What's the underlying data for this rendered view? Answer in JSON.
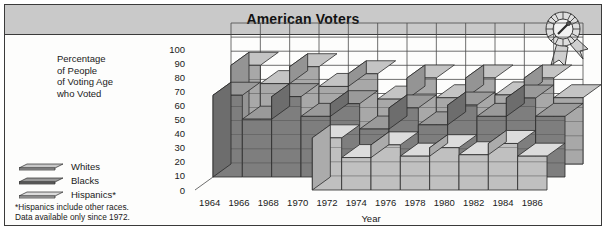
{
  "figure": {
    "title": "American Voters",
    "award_icon": "award-rosette-icon"
  },
  "axis_caption": {
    "line1": "Percentage",
    "line2": "of People",
    "line3": "of Voting Age",
    "line4": "who Voted"
  },
  "legend": {
    "items": [
      {
        "label": "Whites",
        "color": "#c4c4c4"
      },
      {
        "label": "Blacks",
        "color": "#8a8a8a"
      },
      {
        "label": "Hispanics*",
        "color": "#d6d6d6"
      }
    ]
  },
  "footnote": {
    "line1": "*Hispanics include other races.",
    "line2": "Data available only since 1972."
  },
  "colors": {
    "title_bar": "#c9c9c9",
    "frame_border": "#3a3a3a",
    "page_background": "#fdfdfc",
    "whites_top": "#c4c4c4",
    "whites_front": "#a8a8a8",
    "blacks_top": "#9a9a9a",
    "blacks_front": "#7e7e7e",
    "hispanics_top": "#dcdcdc",
    "hispanics_front": "#c0c0c0",
    "grid": "#4a4a4a"
  },
  "chart_data": {
    "type": "area",
    "title": "American Voters",
    "xlabel": "Year",
    "ylabel": "Percentage of People of Voting Age who Voted",
    "ylim": [
      0,
      100
    ],
    "ytick_step": 10,
    "yticks": [
      0,
      10,
      20,
      30,
      40,
      50,
      60,
      70,
      80,
      90,
      100
    ],
    "grid": true,
    "legend_position": "left",
    "projection": "3d-stepped-ribbon",
    "categories": [
      "1964",
      "1966",
      "1968",
      "1970",
      "1972",
      "1974",
      "1976",
      "1978",
      "1980",
      "1982",
      "1984",
      "1986"
    ],
    "series": [
      {
        "name": "Whites",
        "values": [
          70,
          57,
          69,
          55,
          64,
          46,
          61,
          47,
          61,
          49,
          61,
          47
        ]
      },
      {
        "name": "Blacks",
        "values": [
          58,
          41,
          57,
          43,
          52,
          34,
          49,
          37,
          51,
          43,
          56,
          43
        ]
      },
      {
        "name": "Hispanics*",
        "values": [
          null,
          null,
          null,
          null,
          37,
          23,
          32,
          24,
          30,
          25,
          33,
          24
        ]
      }
    ],
    "notes": "Hispanics include other races. Data available only since 1972."
  }
}
